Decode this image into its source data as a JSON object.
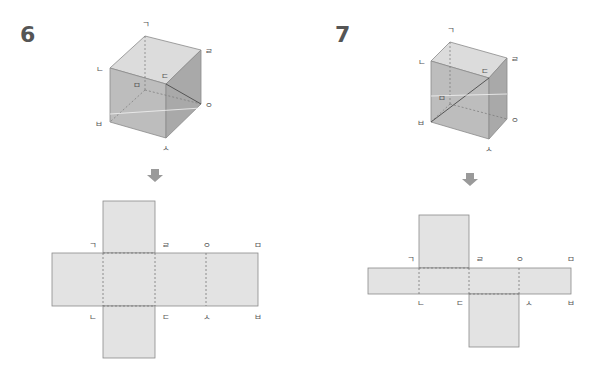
{
  "problems": [
    {
      "number": "6",
      "cube_vertices": {
        "top_back_left": "ㄱ",
        "top_back_right": "ㄹ",
        "top_front_left": "ㄴ",
        "top_front_right": "ㄷ",
        "bottom_back_left": "ㅁ",
        "bottom_front_left": "ㅂ",
        "bottom_front_right": "ㅅ",
        "bottom_back_right": "ㅇ"
      },
      "net_top_labels": [
        "ㄱ",
        "ㄹ",
        "ㅇ",
        "ㅁ"
      ],
      "net_bottom_labels": [
        "ㄴ",
        "ㄷ",
        "ㅅ",
        "ㅂ"
      ]
    },
    {
      "number": "7",
      "cube_vertices": {
        "top_back_left": "ㄱ",
        "top_back_right": "ㄹ",
        "top_front_left": "ㄴ",
        "top_front_right": "ㄷ",
        "bottom_back_left": "ㅁ",
        "bottom_front_left": "ㅂ",
        "bottom_front_right": "ㅅ",
        "bottom_back_right": "ㅇ"
      },
      "net_top_labels": [
        "ㄱ",
        "ㄹ",
        "ㅇ",
        "ㅁ"
      ],
      "net_bottom_labels": [
        "ㄴ",
        "ㄷ",
        "ㅅ",
        "ㅂ"
      ]
    }
  ],
  "colors": {
    "face_top": "#dcdcdc",
    "face_front": "#bdbdbd",
    "face_side": "#a9a9a9",
    "net_fill": "#e3e3e3",
    "edge": "#8a8a8a",
    "arrow": "#9a9a9a"
  }
}
